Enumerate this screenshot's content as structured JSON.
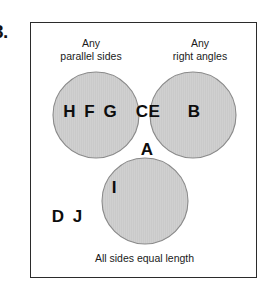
{
  "question": {
    "number": "3."
  },
  "diagram": {
    "type": "venn-3-circle",
    "colors": {
      "circle_fill": "#cccccc",
      "circle_stroke": "#8a8a8a",
      "box_border": "#2b2b2b",
      "text": "#0d0d0d",
      "background": "#ffffff"
    },
    "set_labels": {
      "top_left": "Any\nparallel sides",
      "top_right": "Any\nright angles",
      "bottom": "All sides equal length"
    },
    "circles": [
      {
        "name": "any-parallel-sides",
        "cx": 65,
        "cy": 92,
        "r": 43
      },
      {
        "name": "any-right-angles",
        "cx": 162,
        "cy": 92,
        "r": 43
      },
      {
        "name": "all-sides-equal-length",
        "cx": 114,
        "cy": 178,
        "r": 43
      }
    ],
    "regions": [
      {
        "name": "parallel-only",
        "label": "H F G",
        "members": [
          "H",
          "F",
          "G"
        ]
      },
      {
        "name": "parallel-and-right-angles",
        "label": "CE",
        "members": [
          "C",
          "E"
        ]
      },
      {
        "name": "right-angles-only",
        "label": "B",
        "members": [
          "B"
        ]
      },
      {
        "name": "all-three",
        "label": "A",
        "members": [
          "A"
        ]
      },
      {
        "name": "parallel-and-equal-sides",
        "label": "I",
        "members": [
          "I"
        ]
      },
      {
        "name": "outside-all",
        "label": "D J",
        "members": [
          "D",
          "J"
        ]
      }
    ]
  }
}
